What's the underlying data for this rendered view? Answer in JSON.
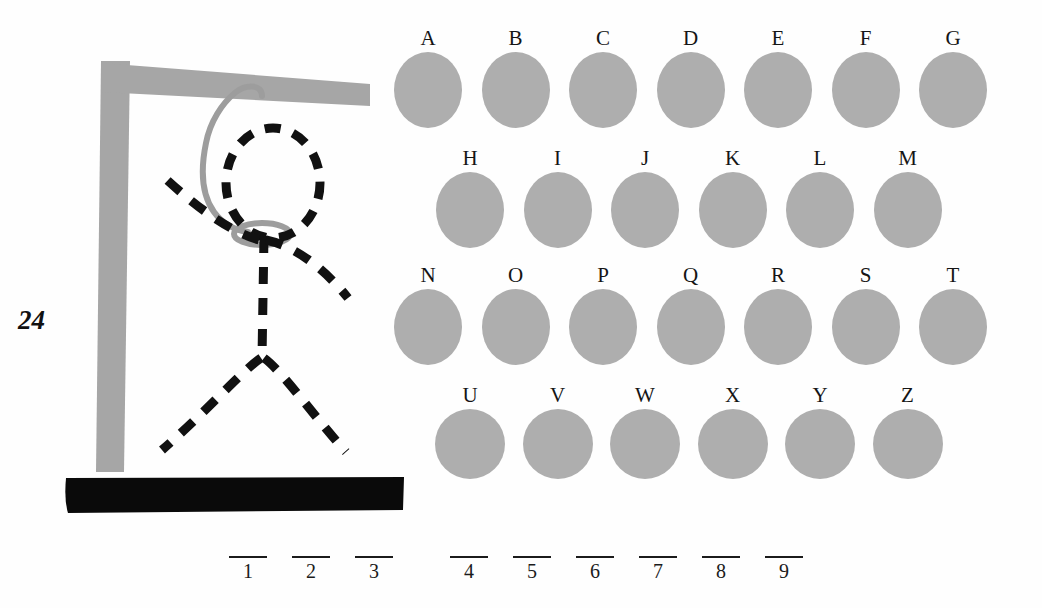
{
  "page": {
    "number": "24",
    "background_color": "#fefefe"
  },
  "colors": {
    "disc_gray": "#aeaeae",
    "gallows_gray": "#a6a6a6",
    "rope_gray": "#9d9d9d",
    "figure_black": "#111111",
    "base_black": "#0a0a0a",
    "text_black": "#151515"
  },
  "drawing": {
    "name": "hangman-gallows",
    "parts": [
      {
        "name": "gallows-post",
        "visible": true
      },
      {
        "name": "gallows-beam",
        "visible": true
      },
      {
        "name": "gallows-base",
        "visible": true
      },
      {
        "name": "noose-rope",
        "visible": true
      },
      {
        "name": "figure-head",
        "visible": true
      },
      {
        "name": "figure-torso",
        "visible": true
      },
      {
        "name": "figure-left-arm",
        "visible": true
      },
      {
        "name": "figure-right-arm",
        "visible": true
      },
      {
        "name": "figure-left-leg",
        "visible": true
      },
      {
        "name": "figure-right-leg",
        "visible": true
      }
    ]
  },
  "letter_grid": {
    "rows": [
      {
        "row_index": 0,
        "left": 14,
        "top": 8,
        "spacing": 87.5,
        "shape": "oval",
        "letters": [
          "A",
          "B",
          "C",
          "D",
          "E",
          "F",
          "G"
        ]
      },
      {
        "row_index": 1,
        "left": 56,
        "top": 128,
        "spacing": 87.5,
        "shape": "oval",
        "letters": [
          "H",
          "I",
          "J",
          "K",
          "L",
          "M"
        ]
      },
      {
        "row_index": 2,
        "left": 14,
        "top": 245,
        "spacing": 87.5,
        "shape": "oval",
        "letters": [
          "N",
          "O",
          "P",
          "Q",
          "R",
          "S",
          "T"
        ]
      },
      {
        "row_index": 3,
        "left": 56,
        "top": 365,
        "spacing": 87.5,
        "shape": "round",
        "letters": [
          "U",
          "V",
          "W",
          "X",
          "Y",
          "Z"
        ]
      }
    ]
  },
  "answer_blanks": {
    "slots": [
      {
        "index": "1",
        "x": 248,
        "group": 0
      },
      {
        "index": "2",
        "x": 311,
        "group": 0
      },
      {
        "index": "3",
        "x": 374,
        "group": 0
      },
      {
        "index": "4",
        "x": 469,
        "group": 1
      },
      {
        "index": "5",
        "x": 532,
        "group": 1
      },
      {
        "index": "6",
        "x": 595,
        "group": 1
      },
      {
        "index": "7",
        "x": 658,
        "group": 1
      },
      {
        "index": "8",
        "x": 721,
        "group": 1
      },
      {
        "index": "9",
        "x": 784,
        "group": 1
      }
    ]
  }
}
